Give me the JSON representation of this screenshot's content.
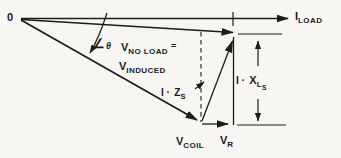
{
  "diagram": {
    "origin": "0",
    "i_load": {
      "main": "I",
      "sub": "LOAD"
    },
    "angle": {
      "symbol": "∠",
      "value": "θ"
    },
    "v_no_load": {
      "main": "V",
      "sub": "NO LOAD",
      "equals": "="
    },
    "v_induced": {
      "main": "V",
      "sub": "INDUCED"
    },
    "i_zs": {
      "prefix": "I ·",
      "main": "Z",
      "sub": "S"
    },
    "v_coil": {
      "main": "V",
      "sub": "COIL"
    },
    "v_r": {
      "main": "V",
      "sub": "R"
    },
    "i_xls": {
      "prefix": "I ·",
      "main": "X",
      "sub": "L",
      "subsub": "S"
    },
    "colors": {
      "ink": "#1c1c1c",
      "background": "#f7f6f2"
    }
  }
}
